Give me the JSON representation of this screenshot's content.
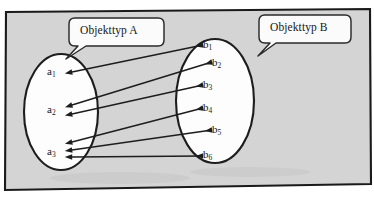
{
  "diagram": {
    "title_a": "Objekttyp A",
    "title_b": "Objekttyp B",
    "background_color": "#d4d4d4",
    "frame_color": "#1a1a1a",
    "set_fill_color": "#fdfdfd",
    "stroke_color": "#1d1d1d",
    "set_a": {
      "label": "Objekttyp A",
      "nodes": [
        {
          "id": "a1",
          "base": "a",
          "sub": "1",
          "x": 57,
          "y": 72
        },
        {
          "id": "a2",
          "base": "a",
          "sub": "2",
          "x": 57,
          "y": 110
        },
        {
          "id": "a3",
          "base": "a",
          "sub": "3",
          "x": 57,
          "y": 152
        }
      ]
    },
    "set_b": {
      "label": "Objekttyp B",
      "nodes": [
        {
          "id": "b1",
          "base": "b",
          "sub": "1",
          "x": 213,
          "y": 45
        },
        {
          "id": "b2",
          "base": "b",
          "sub": "2",
          "x": 222,
          "y": 63
        },
        {
          "id": "b3",
          "base": "b",
          "sub": "3",
          "x": 213,
          "y": 85
        },
        {
          "id": "b4",
          "base": "b",
          "sub": "4",
          "x": 213,
          "y": 108
        },
        {
          "id": "b5",
          "base": "b",
          "sub": "5",
          "x": 222,
          "y": 130
        },
        {
          "id": "b6",
          "base": "b",
          "sub": "6",
          "x": 213,
          "y": 155
        }
      ]
    },
    "connections": [
      {
        "from": "a1",
        "to": "b1",
        "arrow": "both"
      },
      {
        "from": "a2",
        "to": "b2",
        "arrow": "both"
      },
      {
        "from": "a2",
        "to": "b3",
        "arrow": "both"
      },
      {
        "from": "a3",
        "to": "b4",
        "arrow": "both"
      },
      {
        "from": "a3",
        "to": "b5",
        "arrow": "both"
      },
      {
        "from": "a3",
        "to": "b6",
        "arrow": "both"
      }
    ]
  }
}
